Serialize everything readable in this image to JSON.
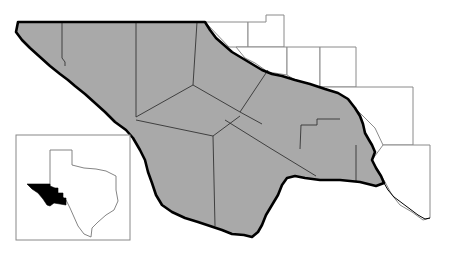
{
  "map": {
    "title": "",
    "description": "Trans-Pecos region of Texas (shaded counties) with adjacent unshaded counties and a Texas locator inset",
    "colors": {
      "background": "#ffffff",
      "region_fill": "#a9a9a9",
      "region_border": "#000000",
      "county_line": "#333333",
      "neighbor_line": "#8a8a8a",
      "inset_highlight": "#000000",
      "inset_frame": "#888888"
    },
    "shaded_region": {
      "label": "",
      "county_count": 9
    },
    "neighbor_counties": {
      "count": 9,
      "fill": "#ffffff"
    },
    "inset": {
      "label": "",
      "state_outline": "Texas",
      "highlight": "Trans-Pecos region"
    }
  }
}
